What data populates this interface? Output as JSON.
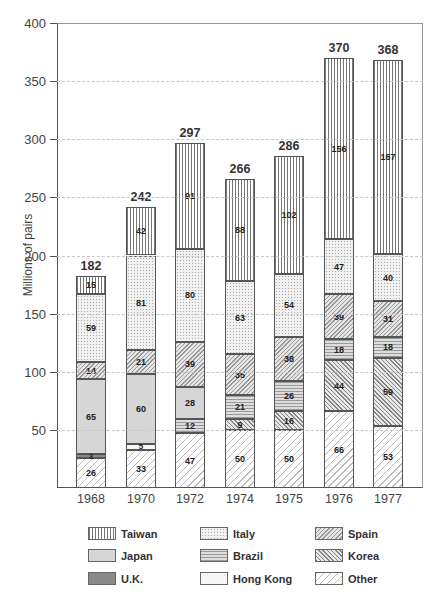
{
  "chart_data": {
    "type": "bar",
    "stacked": true,
    "title": "",
    "xlabel": "",
    "ylabel": "Millions of pairs",
    "ylim": [
      0,
      400
    ],
    "yticks": [
      50,
      100,
      150,
      200,
      250,
      300,
      350,
      400
    ],
    "grid": true,
    "legend_position": "bottom",
    "categories": [
      "1968",
      "1970",
      "1972",
      "1974",
      "1975",
      "1976",
      "1977"
    ],
    "totals": [
      182,
      242,
      297,
      266,
      286,
      370,
      368
    ],
    "stack_order_bottom_to_top": [
      "Other",
      "Hong Kong",
      "U.K.",
      "Korea",
      "Brazil",
      "Japan",
      "Spain",
      "Italy",
      "Taiwan"
    ],
    "series": [
      {
        "name": "Other",
        "values": [
          26,
          33,
          47,
          50,
          50,
          66,
          53
        ]
      },
      {
        "name": "Hong Kong",
        "values": [
          null,
          5,
          null,
          null,
          null,
          null,
          null
        ]
      },
      {
        "name": "U.K.",
        "values": [
          3,
          null,
          null,
          null,
          null,
          null,
          null
        ]
      },
      {
        "name": "Korea",
        "values": [
          null,
          null,
          null,
          9,
          16,
          44,
          59
        ]
      },
      {
        "name": "Brazil",
        "values": [
          null,
          null,
          12,
          21,
          26,
          18,
          18
        ]
      },
      {
        "name": "Japan",
        "values": [
          65,
          60,
          28,
          null,
          null,
          null,
          null
        ]
      },
      {
        "name": "Spain",
        "values": [
          14,
          21,
          39,
          35,
          38,
          39,
          31
        ]
      },
      {
        "name": "Italy",
        "values": [
          59,
          81,
          80,
          63,
          54,
          47,
          40
        ]
      },
      {
        "name": "Taiwan",
        "values": [
          15,
          42,
          91,
          88,
          102,
          156,
          167
        ]
      }
    ],
    "legend": [
      "Taiwan",
      "Italy",
      "Spain",
      "Japan",
      "Brazil",
      "Korea",
      "U.K.",
      "Hong Kong",
      "Other"
    ]
  },
  "legend_labels": [
    "Taiwan",
    "Italy",
    "Spain",
    "Japan",
    "Brazil",
    "Korea",
    "U.K.",
    "Hong Kong",
    "Other"
  ]
}
